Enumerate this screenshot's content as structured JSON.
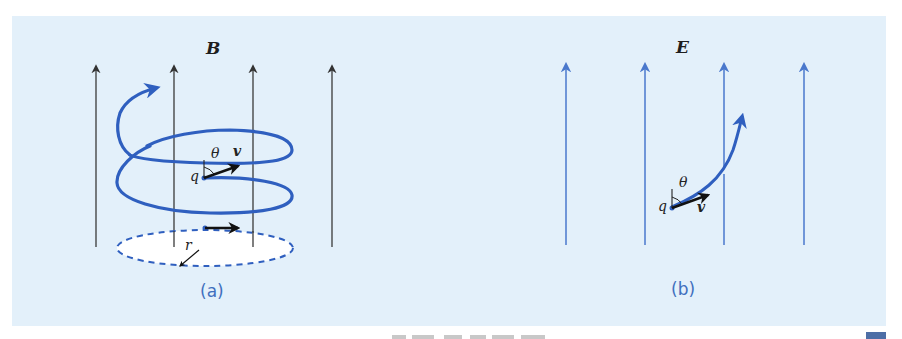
{
  "figure": {
    "background_color": "#e3f0fa",
    "field_line_color_B": "#3a3a3a",
    "field_line_color_E": "#4a78cc",
    "trajectory_color": "#2f5fbf",
    "panel_a": {
      "sublabel": "(a)",
      "field_label": "B",
      "charge_label": "q",
      "velocity_label": "v",
      "angle_label": "θ",
      "radius_label": "r",
      "description": "Helical path of charge q in uniform magnetic field B (4 vertical black field lines)"
    },
    "panel_b": {
      "sublabel": "(b)",
      "field_label": "E",
      "charge_label": "q",
      "velocity_label": "v",
      "angle_label": "θ",
      "description": "Curved (parabolic) path of charge q in uniform electric field E (4 vertical blue field lines)"
    }
  },
  "caption": {
    "visible": "partially cut off at bottom edge"
  }
}
